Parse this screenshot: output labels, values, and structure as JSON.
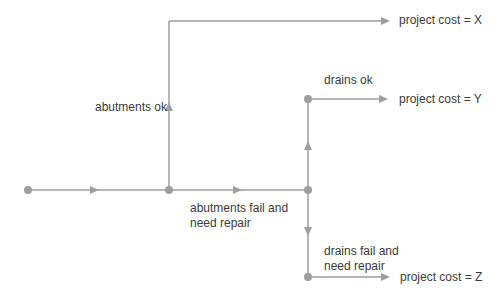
{
  "diagram": {
    "type": "decision-tree",
    "line_color": "#9e9e9e",
    "text_color": "#3a3a3a",
    "labels": {
      "abutments_ok": "abutments ok",
      "abutments_fail_line1": "abutments fail and",
      "abutments_fail_line2": "need repair",
      "drains_ok": "drains ok",
      "drains_fail_line1": "drains fail and",
      "drains_fail_line2": "need repair"
    },
    "outcomes": {
      "x": "project cost = X",
      "y": "project cost = Y",
      "z": "project cost = Z"
    }
  }
}
